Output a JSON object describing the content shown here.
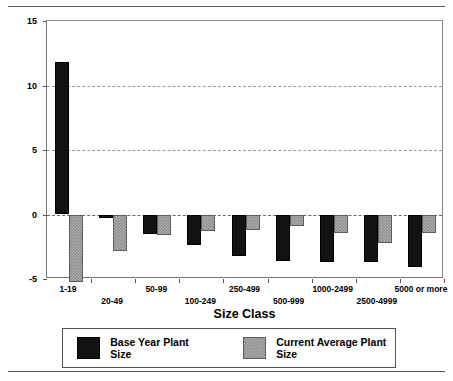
{
  "chart_data": {
    "type": "bar",
    "title": "",
    "xlabel": "Size Class",
    "ylabel": "Mean Annual Rates, 1973 to 1993",
    "categories": [
      "1-19",
      "20-49",
      "50-99",
      "100-249",
      "250-499",
      "500-999",
      "1000-2499",
      "2500-4999",
      "5000 or more"
    ],
    "series": [
      {
        "name": "Base Year Plant Size",
        "color": "#121212",
        "values": [
          11.8,
          -0.3,
          -1.5,
          -2.4,
          -3.2,
          -3.6,
          -3.7,
          -3.7,
          -4.1
        ]
      },
      {
        "name": "Current Average Plant Size",
        "color": "#8f8f8f",
        "values": [
          -5.2,
          -2.8,
          -1.6,
          -1.3,
          -1.2,
          -0.9,
          -1.4,
          -2.2,
          -1.4
        ]
      }
    ],
    "ylim": [
      -5,
      15
    ],
    "yticks": [
      -5,
      0,
      5,
      10,
      15
    ],
    "ytick_labels": [
      "-5",
      "0",
      "5",
      "10",
      "15"
    ],
    "grid": true,
    "legend_position": "bottom"
  },
  "legend": {
    "items": [
      {
        "label": "Base Year Plant Size",
        "swatch": "black-solid-swatch"
      },
      {
        "label": "Current Average Plant Size",
        "swatch": "gray-hatched-swatch"
      }
    ]
  }
}
